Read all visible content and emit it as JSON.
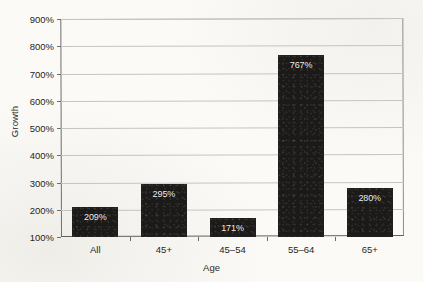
{
  "chart_data": {
    "type": "bar",
    "title": "",
    "xlabel": "Age",
    "ylabel": "Growth",
    "categories": [
      "All",
      "45+",
      "45–54",
      "55–64",
      "65+"
    ],
    "values": [
      209,
      295,
      171,
      767,
      280
    ],
    "data_labels": [
      "209%",
      "295%",
      "171%",
      "767%",
      "280%"
    ],
    "ylim": [
      100,
      900
    ],
    "ytick_values": [
      900,
      800,
      700,
      600,
      500,
      400,
      300,
      200,
      100
    ],
    "ytick_labels": [
      "900%",
      "800%",
      "700%",
      "600%",
      "500%",
      "400%",
      "300%",
      "200%",
      "100%"
    ],
    "grid": true,
    "legend": "none",
    "bar_color": "#1c1a18",
    "label_color": "#f2f0ec",
    "background_color": "#fbfaf7",
    "gridline_color": "#c4c4c4"
  }
}
